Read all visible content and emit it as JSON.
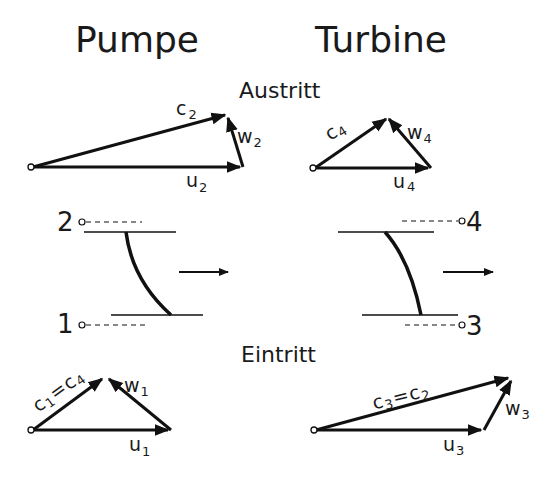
{
  "headers": {
    "pump": "Pumpe",
    "turbine": "Turbine"
  },
  "sections": {
    "outlet": "Austritt",
    "inlet": "Eintritt"
  },
  "stations": {
    "pump_outlet": "2",
    "pump_inlet": "1",
    "turbine_outlet": "4",
    "turbine_inlet": "3"
  },
  "labels": {
    "pump_outlet": {
      "c": "c",
      "c_sub": "2",
      "w": "w",
      "w_sub": "2",
      "u": "u",
      "u_sub": "2"
    },
    "turbine_outlet": {
      "c": "c",
      "c_sub": "4",
      "w": "w",
      "w_sub": "4",
      "u": "u",
      "u_sub": "4"
    },
    "pump_inlet": {
      "c": "c",
      "c_sub": "1",
      "eq": "=",
      "c2": "c",
      "c2_sub": "4",
      "w": "w",
      "w_sub": "1",
      "u": "u",
      "u_sub": "1"
    },
    "turbine_inlet": {
      "c": "c",
      "c_sub": "3",
      "eq": "=",
      "c2": "c",
      "c2_sub": "2",
      "w": "w",
      "w_sub": "3",
      "u": "u",
      "u_sub": "3"
    }
  },
  "colors": {
    "ink": "#111111",
    "background": "#ffffff"
  }
}
